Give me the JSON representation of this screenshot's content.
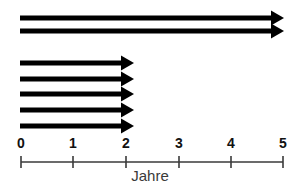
{
  "diagram": {
    "type": "timeline-arrow-diagram",
    "background_color": "#ffffff",
    "arrow_color": "#000000",
    "axis_color": "#3a3a3a",
    "label_color": "#111111",
    "title_color": "#3a3a3a"
  },
  "axis": {
    "name": "jahre-axis",
    "title": "Jahre",
    "title_x": 150,
    "title_y": 168,
    "line_y": 162,
    "line_x_start": 21,
    "line_x_end": 283,
    "tick_half_height": 6,
    "ticks": [
      {
        "label": "0",
        "value": 0,
        "x": 21
      },
      {
        "label": "1",
        "value": 1,
        "x": 73
      },
      {
        "label": "2",
        "value": 2,
        "x": 126
      },
      {
        "label": "3",
        "value": 3,
        "x": 179
      },
      {
        "label": "4",
        "value": 4,
        "x": 231
      },
      {
        "label": "5",
        "value": 5,
        "x": 283
      }
    ],
    "tick_label_y": 136
  },
  "arrows": [
    {
      "name": "arrow-1",
      "group": "long",
      "start_value": 0,
      "end_value": 5.0,
      "x_start": 20,
      "x_tip": 284,
      "y": 18,
      "thickness": 5
    },
    {
      "name": "arrow-2",
      "group": "long",
      "start_value": 0,
      "end_value": 5.0,
      "x_start": 20,
      "x_tip": 284,
      "y": 31,
      "thickness": 5
    },
    {
      "name": "arrow-3",
      "group": "short",
      "start_value": 0,
      "end_value": 2.0,
      "x_start": 20,
      "x_tip": 134,
      "y": 63,
      "thickness": 5
    },
    {
      "name": "arrow-4",
      "group": "short",
      "start_value": 0,
      "end_value": 2.0,
      "x_start": 20,
      "x_tip": 134,
      "y": 79,
      "thickness": 5
    },
    {
      "name": "arrow-5",
      "group": "short",
      "start_value": 0,
      "end_value": 2.0,
      "x_start": 20,
      "x_tip": 134,
      "y": 94,
      "thickness": 5
    },
    {
      "name": "arrow-6",
      "group": "short",
      "start_value": 0,
      "end_value": 2.0,
      "x_start": 20,
      "x_tip": 134,
      "y": 110,
      "thickness": 5
    },
    {
      "name": "arrow-7",
      "group": "short",
      "start_value": 0,
      "end_value": 2.0,
      "x_start": 20,
      "x_tip": 134,
      "y": 126,
      "thickness": 5
    }
  ],
  "chart_data": {
    "type": "bar",
    "title": "",
    "xlabel": "Jahre",
    "ylabel": "",
    "xlim": [
      0,
      5
    ],
    "categories": [
      "arrow-1",
      "arrow-2",
      "arrow-3",
      "arrow-4",
      "arrow-5",
      "arrow-6",
      "arrow-7"
    ],
    "values": [
      5.0,
      5.0,
      2.0,
      2.0,
      2.0,
      2.0,
      2.0
    ],
    "tick_labels": [
      "0",
      "1",
      "2",
      "3",
      "4",
      "5"
    ],
    "grid": false,
    "legend": "none"
  }
}
